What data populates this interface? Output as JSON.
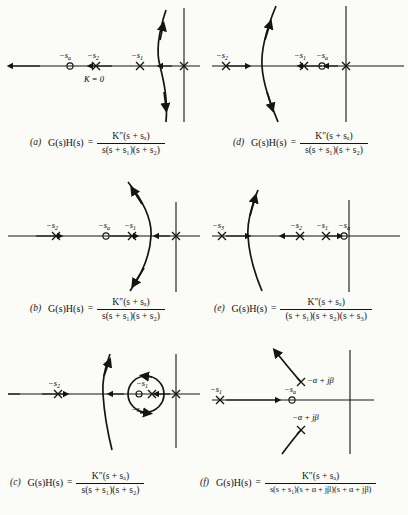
{
  "figure": {
    "axis_color": "#141414",
    "locus_color": "#141414"
  },
  "panels": [
    {
      "tag": "(a)",
      "lhs": "G(s)H(s)",
      "equals": "=",
      "numerator": "K″(s + sₐ)",
      "denominator": "s(s + s₁)(s + s₂)",
      "annotation": "K = 0",
      "zeros": [
        {
          "label": "−sₐ"
        }
      ],
      "poles": [
        {
          "label": "−s₂"
        },
        {
          "label": "−s₁"
        },
        {
          "label": "origin"
        }
      ],
      "locus": "near-vertical branch crossing the real axis just left of the origin, arrows up and down"
    },
    {
      "tag": "(d)",
      "lhs": "G(s)H(s)",
      "equals": "=",
      "numerator": "K″(s + sₐ)",
      "denominator": "s(s + s₁)(s + s₂)",
      "annotation": "",
      "zeros": [
        {
          "label": "−sₐ"
        }
      ],
      "poles": [
        {
          "label": "−s₂"
        },
        {
          "label": "−s₁"
        },
        {
          "label": "origin"
        }
      ],
      "locus": "branch bowing left, crossing the real axis between −s₂ and −s₁"
    },
    {
      "tag": "(b)",
      "lhs": "G(s)H(s)",
      "equals": "=",
      "numerator": "K″(s + sₐ)",
      "denominator": "s(s + s₁)(s + s₂)",
      "annotation": "",
      "zeros": [
        {
          "label": "−sₐ"
        }
      ],
      "poles": [
        {
          "label": "−s₂"
        },
        {
          "label": "−s₁"
        },
        {
          "label": "origin"
        }
      ],
      "locus": "branch bowing right, crossing the real axis between −s₁ and the origin"
    },
    {
      "tag": "(e)",
      "lhs": "G(s)H(s)",
      "equals": "=",
      "numerator": "K″(s + sₐ)",
      "denominator": "(s + s₁)(s + s₂)(s + s₃)",
      "annotation": "",
      "zeros": [
        {
          "label": "−sₐ"
        }
      ],
      "poles": [
        {
          "label": "−s₃"
        },
        {
          "label": "−s₂"
        },
        {
          "label": "−s₁"
        }
      ],
      "locus": "branch bowing left, crossing the real axis between −s₃ and −s₂"
    },
    {
      "tag": "(c)",
      "lhs": "G(s)H(s)",
      "equals": "=",
      "numerator": "K″(s + sₐ)",
      "denominator": "s(s + s₁)(s + s₂)",
      "annotation": "",
      "zeros": [
        {
          "label": "−sₐ"
        }
      ],
      "poles": [
        {
          "label": "−s₂"
        },
        {
          "label": "−s₁"
        },
        {
          "label": "origin"
        }
      ],
      "locus": "circular locus encircling the zero −sₐ and pole −s₁, plus a vertical branch"
    },
    {
      "tag": "(f)",
      "lhs": "G(s)H(s)",
      "equals": "=",
      "numerator": "K″(s + sₐ)",
      "denominator": "s(s + s₁)(s + α + jβ)(s + α + jβ)",
      "annotation": "",
      "zeros": [
        {
          "label": "−sₐ"
        }
      ],
      "poles": [
        {
          "label": "−s₁"
        },
        {
          "label": "−α + jβ"
        },
        {
          "label": "−α + jβ"
        }
      ],
      "locus": "branches departing from the complex poles toward the upper left"
    }
  ],
  "labels": {
    "s_a": "−sₐ",
    "s_1": "−s₁",
    "s_2": "−s₂",
    "s_3": "−s₃",
    "k_zero": "K = 0",
    "complex_upper": "−α + jβ",
    "complex_lower": "−α + jβ"
  }
}
